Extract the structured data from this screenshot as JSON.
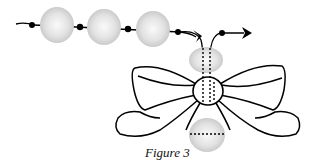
{
  "figure": {
    "caption": "Figure 3"
  },
  "colors": {
    "line": "#000000",
    "bead_fill": "#d8d8d8",
    "bead_highlight": "#f7f7f7",
    "background": "#ffffff"
  },
  "elements": {
    "strand_beads": 3,
    "knots": 4,
    "arrows": 2,
    "bow_loops": 4,
    "center_bead": 1,
    "top_bead": 1,
    "bottom_bead": 1
  }
}
